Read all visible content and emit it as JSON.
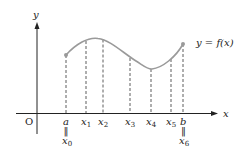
{
  "axes": {
    "x_label": "x",
    "y_label": "y",
    "origin_label": "O"
  },
  "curve": {
    "label": "y = f(x)",
    "color": "#9a9a9a"
  },
  "points": [
    {
      "name": "a",
      "alt": "x",
      "alt_sub": "0",
      "eq": "‖"
    },
    {
      "name": "x",
      "sub": "1"
    },
    {
      "name": "x",
      "sub": "2"
    },
    {
      "name": "x",
      "sub": "3"
    },
    {
      "name": "x",
      "sub": "4"
    },
    {
      "name": "x",
      "sub": "5"
    },
    {
      "name": "b",
      "alt": "x",
      "alt_sub": "6",
      "eq": "‖"
    }
  ],
  "colors": {
    "axis": "#222222",
    "curve": "#9a9a9a",
    "dash": "#333333"
  }
}
